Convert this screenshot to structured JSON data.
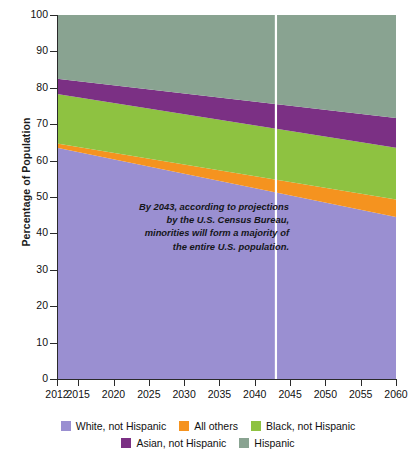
{
  "chart_data": {
    "type": "area",
    "title": "",
    "subtitle": "",
    "xlabel": "",
    "ylabel": "Percentage of Population",
    "stacked": true,
    "stack_order": "bottom-to-top",
    "grid": false,
    "legend_position": "bottom",
    "x": [
      2012,
      2060
    ],
    "xlim": [
      2012,
      2060
    ],
    "ylim": [
      0,
      100
    ],
    "xticks": [
      2012,
      2015,
      2020,
      2025,
      2030,
      2035,
      2040,
      2045,
      2050,
      2055,
      2060
    ],
    "xtick_labels": [
      "2012",
      "2015",
      "2020",
      "2025",
      "2030",
      "2035",
      "2040",
      "2045",
      "2050",
      "2055",
      "2060"
    ],
    "yticks": [
      0,
      10,
      20,
      30,
      40,
      50,
      60,
      70,
      80,
      90,
      100
    ],
    "ytick_labels": [
      "0",
      "10",
      "20",
      "30",
      "40",
      "50",
      "60",
      "70",
      "80",
      "90",
      "100"
    ],
    "series": [
      {
        "name": "White, not Hispanic",
        "color": "#9a8fd1",
        "values": [
          63.5,
          44.5
        ]
      },
      {
        "name": "All others",
        "color": "#f5931f",
        "values": [
          1.2,
          4.8
        ]
      },
      {
        "name": "Black, not Hispanic",
        "color": "#8ec241",
        "values": [
          13.6,
          14.2
        ]
      },
      {
        "name": "Asian, not Hispanic",
        "color": "#7b3084",
        "values": [
          4.2,
          8.2
        ]
      },
      {
        "name": "Hispanic",
        "color": "#89a391",
        "values": [
          17.5,
          28.3
        ]
      }
    ],
    "cumulative_tops": {
      "2012": [
        63.5,
        64.7,
        78.3,
        82.5,
        100
      ],
      "2060": [
        44.5,
        49.3,
        63.5,
        71.7,
        100
      ]
    },
    "marker_line": {
      "year": 2043,
      "color": "#ffffff",
      "label": ""
    },
    "annotation": {
      "lines": [
        "By 2043, according to projections",
        "by the U.S. Census Bureau,",
        "minorities will form a majority of",
        "the entire U.S. population."
      ]
    }
  },
  "legend": {
    "rows": [
      [
        {
          "label": "White, not Hispanic",
          "color": "#9a8fd1"
        },
        {
          "label": "All others",
          "color": "#f5931f"
        },
        {
          "label": "Black, not Hispanic",
          "color": "#8ec241"
        }
      ],
      [
        {
          "label": "Asian, not Hispanic",
          "color": "#7b3084"
        },
        {
          "label": "Hispanic",
          "color": "#89a391"
        }
      ]
    ]
  }
}
